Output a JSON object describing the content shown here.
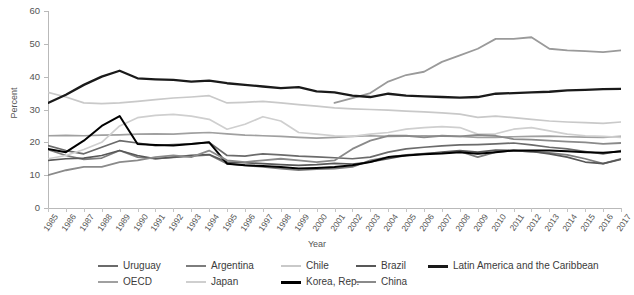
{
  "chart_data": {
    "type": "line",
    "title": "",
    "xlabel": "Year",
    "ylabel": "Percent",
    "ylim": [
      0,
      60
    ],
    "yticks": [
      0,
      10,
      20,
      30,
      40,
      50,
      60
    ],
    "grid": false,
    "legend_position": "bottom",
    "x": [
      1985,
      1986,
      1987,
      1988,
      1989,
      1990,
      1991,
      1992,
      1993,
      1994,
      1995,
      1996,
      1997,
      1998,
      1999,
      2000,
      2001,
      2002,
      2003,
      2004,
      2005,
      2006,
      2007,
      2008,
      2009,
      2010,
      2011,
      2012,
      2013,
      2014,
      2015,
      2016,
      2017
    ],
    "series": [
      {
        "name": "Uruguay",
        "color": "#6b6b6b",
        "width": 1.7,
        "values": [
          19.0,
          17.5,
          16.5,
          18.5,
          20.5,
          19.8,
          19.0,
          19.3,
          19.5,
          20.0,
          16.0,
          15.8,
          16.5,
          16.2,
          15.8,
          15.6,
          15.3,
          15.0,
          15.5,
          17.0,
          18.0,
          18.5,
          18.9,
          19.2,
          19.3,
          19.5,
          19.8,
          19.2,
          18.5,
          18.0,
          17.2,
          16.5,
          17.5
        ]
      },
      {
        "name": "Argentina",
        "color": "#7d7d7d",
        "width": 1.7,
        "values": [
          17.8,
          16.0,
          14.8,
          15.2,
          17.5,
          15.5,
          15.0,
          15.4,
          15.8,
          16.2,
          13.5,
          13.0,
          12.5,
          12.0,
          11.5,
          11.8,
          12.0,
          12.5,
          14.5,
          15.5,
          16.2,
          16.6,
          16.8,
          17.2,
          15.5,
          17.0,
          17.5,
          17.2,
          16.8,
          16.2,
          15.0,
          13.5,
          15.0
        ]
      },
      {
        "name": "Chile",
        "color": "#c9c9c9",
        "width": 1.7,
        "values": [
          35.2,
          33.8,
          32.0,
          31.8,
          32.0,
          32.5,
          33.0,
          33.5,
          33.8,
          34.2,
          32.0,
          32.2,
          32.5,
          32.0,
          31.5,
          31.0,
          30.5,
          30.2,
          30.0,
          29.8,
          29.5,
          29.3,
          29.0,
          28.6,
          27.6,
          28.0,
          27.5,
          27.0,
          26.5,
          26.2,
          26.0,
          25.8,
          26.2
        ]
      },
      {
        "name": "Brazil",
        "color": "#585858",
        "width": 1.7,
        "values": [
          14.5,
          15.0,
          15.2,
          16.0,
          17.5,
          16.0,
          15.0,
          15.5,
          16.0,
          16.3,
          14.0,
          13.8,
          13.5,
          13.2,
          13.0,
          13.2,
          13.6,
          13.4,
          14.0,
          15.0,
          16.0,
          16.5,
          17.0,
          17.5,
          17.0,
          17.6,
          17.5,
          17.2,
          16.5,
          15.5,
          14.0,
          13.5,
          14.8
        ]
      },
      {
        "name": "Latin America and the Caribbean",
        "color": "#1a1a1a",
        "width": 2.3,
        "values": [
          32.0,
          34.5,
          37.5,
          40.0,
          41.8,
          39.5,
          39.2,
          39.0,
          38.5,
          38.8,
          38.0,
          37.5,
          37.0,
          36.5,
          36.8,
          35.5,
          35.2,
          34.2,
          33.8,
          34.8,
          34.2,
          34.0,
          33.8,
          33.6,
          33.8,
          34.8,
          35.0,
          35.2,
          35.4,
          35.8,
          36.0,
          36.2,
          36.3
        ]
      },
      {
        "name": "OECD",
        "color": "#a0a0a0",
        "width": 1.7,
        "values": [
          22.0,
          22.1,
          22.0,
          22.2,
          22.3,
          22.5,
          22.6,
          22.5,
          22.8,
          23.0,
          22.6,
          22.2,
          22.0,
          21.8,
          21.5,
          21.3,
          21.5,
          21.8,
          22.0,
          21.8,
          21.9,
          22.0,
          21.9,
          21.8,
          21.5,
          21.5,
          21.7,
          21.8,
          21.9,
          21.7,
          21.6,
          21.5,
          21.8
        ]
      },
      {
        "name": "Japan",
        "color": "#cfcfcf",
        "width": 1.7,
        "values": [
          15.0,
          16.0,
          17.8,
          20.0,
          25.0,
          27.5,
          28.2,
          28.5,
          28.0,
          27.0,
          24.0,
          25.5,
          27.8,
          26.5,
          23.0,
          22.5,
          22.0,
          21.8,
          22.5,
          23.0,
          24.0,
          24.5,
          24.8,
          24.5,
          22.5,
          22.6,
          24.0,
          24.5,
          23.5,
          22.5,
          22.0,
          21.8,
          21.5
        ]
      },
      {
        "name": "Korea, Rep.",
        "color": "#000000",
        "width": 2.0,
        "values": [
          18.0,
          17.0,
          20.5,
          25.0,
          28.0,
          19.5,
          19.2,
          19.0,
          19.5,
          20.0,
          13.5,
          13.0,
          12.8,
          12.5,
          12.0,
          12.2,
          12.5,
          13.0,
          14.0,
          15.5,
          16.0,
          16.4,
          16.6,
          17.0,
          16.5,
          17.0,
          17.5,
          17.5,
          17.5,
          17.3,
          17.0,
          16.8,
          17.2
        ]
      },
      {
        "name": "China",
        "color": "#8a8a8a",
        "width": 1.8,
        "values": [
          10.0,
          11.5,
          12.5,
          12.5,
          14.0,
          14.5,
          15.5,
          16.0,
          15.5,
          17.5,
          14.5,
          14.0,
          14.5,
          15.0,
          14.5,
          14.0,
          14.5,
          18.0,
          20.5,
          22.0,
          22.0,
          21.5,
          22.0,
          21.8,
          22.3,
          22.0,
          21.0,
          20.8,
          20.5,
          20.2,
          20.0,
          19.5,
          19.8
        ]
      },
      {
        "name": "China-high",
        "color": "#9a9a9a",
        "width": 1.8,
        "hidden_from_legend": true,
        "values": [
          null,
          null,
          null,
          null,
          null,
          null,
          null,
          null,
          null,
          null,
          null,
          null,
          null,
          null,
          null,
          null,
          null,
          null,
          null,
          null,
          null,
          null,
          null,
          null,
          null,
          null,
          null,
          null,
          null,
          null,
          null,
          null,
          null
        ]
      }
    ],
    "china_upper_track": {
      "note": "the upper grey curve rising to ~52",
      "values": [
        null,
        null,
        null,
        null,
        null,
        null,
        null,
        null,
        null,
        null,
        null,
        null,
        null,
        null,
        null,
        null,
        32.0,
        33.5,
        35.0,
        38.5,
        40.5,
        41.5,
        44.5,
        46.5,
        48.5,
        51.5,
        51.5,
        52.0,
        48.5,
        48.0,
        47.8,
        47.5,
        48.0
      ]
    }
  },
  "legend": {
    "rows": [
      [
        {
          "label": "Uruguay",
          "color": "#6b6b6b",
          "width": 2,
          "x": 0
        },
        {
          "label": "Argentina",
          "color": "#7d7d7d",
          "width": 2,
          "x": 88
        },
        {
          "label": "Chile",
          "color": "#c9c9c9",
          "width": 2,
          "x": 183
        },
        {
          "label": "Brazil",
          "color": "#585858",
          "width": 2,
          "x": 258
        },
        {
          "label": "Latin America and the Caribbean",
          "color": "#1a1a1a",
          "width": 3,
          "x": 330
        }
      ],
      [
        {
          "label": "OECD",
          "color": "#a0a0a0",
          "width": 2,
          "x": 0
        },
        {
          "label": "Japan",
          "color": "#cfcfcf",
          "width": 2,
          "x": 88
        },
        {
          "label": "Korea, Rep.",
          "color": "#000000",
          "width": 3,
          "x": 183
        },
        {
          "label": "China",
          "color": "#8a8a8a",
          "width": 2,
          "x": 258
        }
      ]
    ]
  }
}
